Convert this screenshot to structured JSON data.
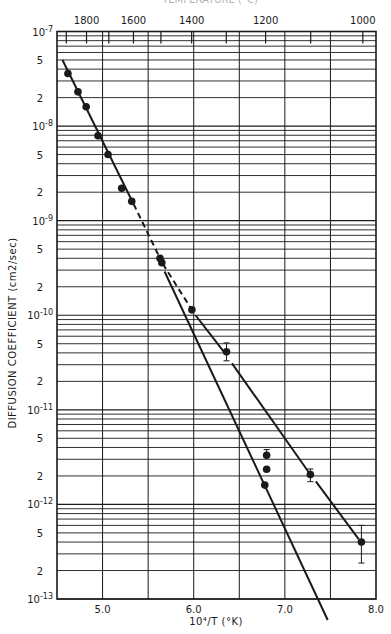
{
  "chart_data": {
    "type": "scatter",
    "title": "",
    "top_title_clipped": "TEMPERATURE (°C)",
    "xlabel": "10⁴/T (°K)",
    "ylabel": "DIFFUSION COEFFICIENT (cm2/sec)",
    "xlim": [
      4.5,
      8.0
    ],
    "ylim_log10": [
      -13,
      -7
    ],
    "yscale": "log",
    "grid": true,
    "x_ticks": [
      {
        "value": 5.0,
        "label": "5.0"
      },
      {
        "value": 6.0,
        "label": "6.0"
      },
      {
        "value": 7.0,
        "label": "7.0"
      },
      {
        "value": 8.0,
        "label": "8.0"
      }
    ],
    "x_gridlines": [
      5.0,
      5.5,
      6.0,
      6.5,
      7.0,
      7.5
    ],
    "y_decade_labels": [
      {
        "exp": -7,
        "label": "10",
        "sup": "-7"
      },
      {
        "exp": -8,
        "label": "10",
        "sup": "-8"
      },
      {
        "exp": -9,
        "label": "10",
        "sup": "-9"
      },
      {
        "exp": -10,
        "label": "10",
        "sup": "-10"
      },
      {
        "exp": -11,
        "label": "10",
        "sup": "-11"
      },
      {
        "exp": -12,
        "label": "10",
        "sup": "-12"
      },
      {
        "exp": -13,
        "label": "10",
        "sup": "-13"
      }
    ],
    "y_minor_labels": [
      "5",
      "2"
    ],
    "top_axis": {
      "unit": "°C",
      "labels": [
        {
          "temp_c": 1800,
          "label": "1800"
        },
        {
          "temp_c": 1600,
          "label": "1600"
        },
        {
          "temp_c": 1400,
          "label": "1400"
        },
        {
          "temp_c": 1200,
          "label": "1200"
        },
        {
          "temp_c": 1000,
          "label": "1000"
        }
      ],
      "ticks_c": [
        1900,
        1800,
        1700,
        1600,
        1500,
        1400,
        1300,
        1200,
        1100,
        1000
      ]
    },
    "series": [
      {
        "name": "data points",
        "points": [
          {
            "x": 4.62,
            "y": 3.6e-08
          },
          {
            "x": 4.73,
            "y": 2.3e-08
          },
          {
            "x": 4.82,
            "y": 1.6e-08
          },
          {
            "x": 4.95,
            "y": 7.9e-09
          },
          {
            "x": 5.06,
            "y": 5e-09
          },
          {
            "x": 5.21,
            "y": 2.2e-09
          },
          {
            "x": 5.32,
            "y": 1.6e-09
          },
          {
            "x": 5.63,
            "y": 4e-10
          },
          {
            "x": 5.65,
            "y": 3.6e-10
          },
          {
            "x": 5.98,
            "y": 1.14e-10
          },
          {
            "x": 6.36,
            "y": 4.1e-11,
            "err_low": 3.3e-11,
            "err_high": 5.1e-11
          },
          {
            "x": 6.8,
            "y": 3.3e-12,
            "err_high": 3.8e-12
          },
          {
            "x": 6.8,
            "y": 2.35e-12
          },
          {
            "x": 6.78,
            "y": 1.6e-12
          },
          {
            "x": 7.28,
            "y": 2.07e-12,
            "err_low": 1.74e-12,
            "err_high": 2.37e-12
          },
          {
            "x": 7.84,
            "y": 4e-13,
            "err_low": 2.4e-13,
            "err_high": 6e-13
          }
        ]
      }
    ],
    "fit_lines": [
      {
        "name": "high-T solid fit",
        "style": "solid",
        "from": {
          "x": 4.56,
          "y": 5e-08
        },
        "to": {
          "x": 5.34,
          "y": 1.5e-09
        }
      },
      {
        "name": "dashed extension",
        "style": "dashed",
        "from": {
          "x": 5.34,
          "y": 1.5e-09
        },
        "to": {
          "x": 5.66,
          "y": 3.5e-10
        }
      },
      {
        "name": "dashed to 1.1e-10",
        "style": "dashed",
        "from": {
          "x": 5.66,
          "y": 3.5e-10
        },
        "to": {
          "x": 5.98,
          "y": 1.14e-10
        }
      },
      {
        "name": "steep extrapolation",
        "style": "solid",
        "from": {
          "x": 5.68,
          "y": 2.9e-10
        },
        "to": {
          "x": 7.47,
          "y": 6e-14
        }
      },
      {
        "name": "low-T segment 1",
        "style": "solid",
        "from": {
          "x": 6.02,
          "y": 1e-10
        },
        "to": {
          "x": 6.34,
          "y": 4e-11
        }
      },
      {
        "name": "low-T segment 2",
        "style": "solid",
        "from": {
          "x": 6.42,
          "y": 3.1e-11
        },
        "to": {
          "x": 7.26,
          "y": 2.2e-12
        }
      },
      {
        "name": "low-T segment 3",
        "style": "solid",
        "from": {
          "x": 7.34,
          "y": 1.75e-12
        },
        "to": {
          "x": 7.81,
          "y": 4.3e-13
        }
      }
    ]
  },
  "layout": {
    "plot_left": 57,
    "plot_right": 376,
    "plot_top": 31.5,
    "plot_bottom": 599,
    "ink_color": "#1a1a1a"
  }
}
